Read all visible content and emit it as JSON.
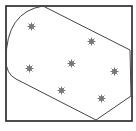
{
  "diagram": {
    "type": "convex-hull-with-rounded-corners",
    "frame": {
      "x": 6,
      "y": 6,
      "width": 126,
      "height": 115,
      "stroke": "#222222"
    },
    "hull": {
      "stroke": "#444444",
      "path": "M 43 6 L 130 50 L 131 96 L 96 120 L 16 79 Q 6 74 6 60 Q 6 12 43 6 Z"
    },
    "marker_icon": "asterisk-star-icon",
    "marker_color": "#777777",
    "points": [
      {
        "x": 31,
        "y": 26
      },
      {
        "x": 91,
        "y": 41
      },
      {
        "x": 29,
        "y": 68
      },
      {
        "x": 71,
        "y": 63
      },
      {
        "x": 114,
        "y": 71
      },
      {
        "x": 61,
        "y": 90
      },
      {
        "x": 101,
        "y": 98
      }
    ]
  }
}
